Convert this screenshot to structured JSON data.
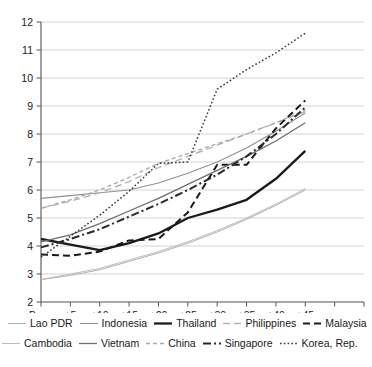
{
  "chart_data": {
    "type": "line",
    "title": "",
    "xlabel": "",
    "ylabel": "",
    "ylim": [
      2,
      12
    ],
    "yticks": [
      2,
      3,
      4,
      5,
      6,
      7,
      8,
      9,
      10,
      11,
      12
    ],
    "grid": true,
    "legend_position": "bottom",
    "x": [
      "Base",
      "+5",
      "+10",
      "+15",
      "+20",
      "+25",
      "+30",
      "+35",
      "+40",
      "+45"
    ],
    "xticks_labeled": [
      "Base",
      "+5",
      "+10",
      "+15",
      "+20",
      "+25",
      "+30",
      "+35",
      "+40",
      "+45"
    ],
    "xticks_unlabeled_count": 2,
    "series": [
      {
        "name": "Lao PDR",
        "style": "solid-thin-light",
        "color": "#b0b0b0",
        "values": [
          2.8,
          2.95,
          3.15,
          3.45,
          3.75,
          4.1,
          4.5,
          4.95,
          5.45,
          6.0
        ]
      },
      {
        "name": "Indonesia",
        "style": "solid-thin",
        "color": "#909090",
        "values": [
          5.7,
          5.8,
          5.9,
          6.0,
          6.25,
          6.6,
          7.0,
          7.5,
          8.1,
          8.75
        ]
      },
      {
        "name": "Thailand",
        "style": "solid-thick",
        "color": "#1a1a1a",
        "values": [
          4.25,
          4.05,
          3.85,
          4.1,
          4.45,
          5.0,
          5.3,
          5.65,
          6.4,
          7.4
        ]
      },
      {
        "name": "Philippines",
        "style": "dashed-light",
        "color": "#b4b4b4",
        "values": [
          5.35,
          5.6,
          5.9,
          6.3,
          6.8,
          7.2,
          7.6,
          8.0,
          8.4,
          8.8
        ]
      },
      {
        "name": "Malaysia",
        "style": "dashed-dark",
        "color": "#1a1a1a",
        "values": [
          3.7,
          3.65,
          3.8,
          4.2,
          4.25,
          5.2,
          6.9,
          6.9,
          8.2,
          9.2
        ]
      },
      {
        "name": "Cambodia",
        "style": "solid-thin-light2",
        "color": "#bdbdbd",
        "values": [
          2.8,
          3.0,
          3.2,
          3.5,
          3.8,
          4.15,
          4.55,
          5.0,
          5.5,
          6.05
        ]
      },
      {
        "name": "Vietnam",
        "style": "solid-medium",
        "color": "#6e6e6e",
        "values": [
          4.15,
          4.4,
          4.8,
          5.25,
          5.7,
          6.2,
          6.7,
          7.2,
          7.75,
          8.4
        ]
      },
      {
        "name": "China",
        "style": "dashed-fine-light",
        "color": "#a8a8a8",
        "values": [
          5.35,
          5.65,
          6.0,
          6.45,
          6.95,
          7.3,
          7.65,
          8.0,
          8.4,
          8.85
        ]
      },
      {
        "name": "Singapore",
        "style": "dash-dot",
        "color": "#2a2a2a",
        "values": [
          3.95,
          4.25,
          4.6,
          5.05,
          5.5,
          6.0,
          6.55,
          7.2,
          8.0,
          8.95
        ]
      },
      {
        "name": "Korea, Rep.",
        "style": "dotted",
        "color": "#3a3a3a",
        "values": [
          3.6,
          4.35,
          5.1,
          5.95,
          6.95,
          7.0,
          9.6,
          10.3,
          10.9,
          11.6
        ]
      }
    ]
  },
  "legend": {
    "row1": [
      {
        "label": "Lao PDR",
        "swatch": "solid-thin-light"
      },
      {
        "label": "Indonesia",
        "swatch": "solid-thin"
      },
      {
        "label": "Thailand",
        "swatch": "solid-thick"
      },
      {
        "label": "Philippines",
        "swatch": "dashed-light"
      },
      {
        "label": "Malaysia",
        "swatch": "dashed-dark"
      }
    ],
    "row2": [
      {
        "label": "Cambodia",
        "swatch": "solid-thin-light2"
      },
      {
        "label": "Vietnam",
        "swatch": "solid-medium"
      },
      {
        "label": "China",
        "swatch": "dashed-fine-light"
      },
      {
        "label": "Singapore",
        "swatch": "dash-dot"
      },
      {
        "label": "Korea, Rep.",
        "swatch": "dotted"
      }
    ]
  }
}
